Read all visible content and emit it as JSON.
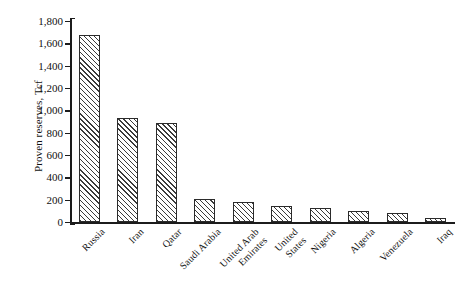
{
  "chart_data": {
    "type": "bar",
    "title": "",
    "subtitle": "",
    "xlabel": "",
    "ylabel": "Proven reserves, Tcf",
    "ylim": [
      0,
      1800
    ],
    "ytick_labels": [
      "1,800",
      "1,600",
      "1,400",
      "1,200",
      "1,000",
      "800",
      "600",
      "400",
      "200",
      "0"
    ],
    "ytick_values": [
      1800,
      1600,
      1400,
      1200,
      1000,
      800,
      600,
      400,
      200,
      0
    ],
    "grid": false,
    "legend": null,
    "legend_position": "none",
    "bar_fill": "hatched-diagonal",
    "bar_edge_color": "#2b2b2b",
    "categories": [
      "Russia",
      "Iran",
      "Qatar",
      "Saudi Arabia",
      "United Arab Emirates",
      "United States",
      "Nigeria",
      "Algeria",
      "Venezuela",
      "Iraq"
    ],
    "category_labels_wrapped": [
      "Russia",
      "Iran",
      "Qatar",
      "Saudi Arabia",
      "United Arab\nEmirates",
      "United\nStates",
      "Nigeria",
      "Algeria",
      "Venezuela",
      "Iraq"
    ],
    "values": [
      1675,
      930,
      890,
      210,
      175,
      145,
      125,
      100,
      80,
      35
    ],
    "units": "Tcf"
  }
}
